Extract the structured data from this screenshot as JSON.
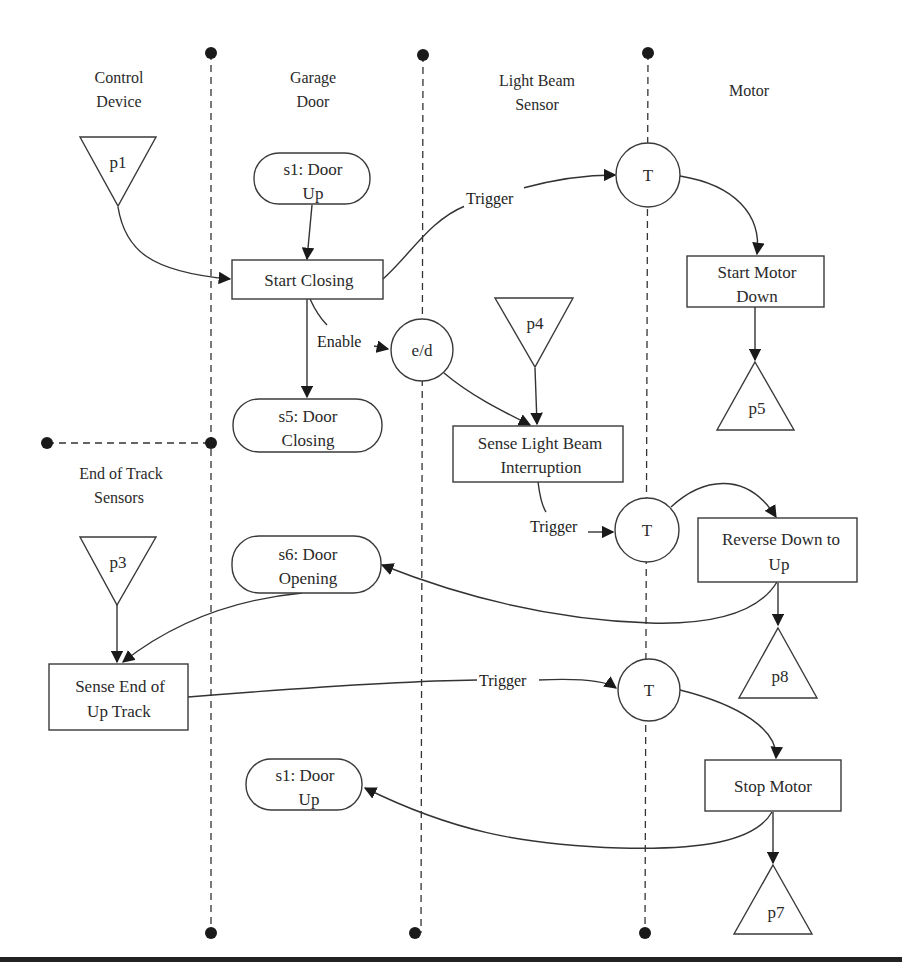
{
  "diagram": {
    "type": "swimlane-process-diagram",
    "lanes": [
      {
        "id": "control-device",
        "title_line1": "Control",
        "title_line2": "Device"
      },
      {
        "id": "garage-door",
        "title_line1": "Garage",
        "title_line2": "Door"
      },
      {
        "id": "light-beam-sensor",
        "title_line1": "Light Beam",
        "title_line2": "Sensor"
      },
      {
        "id": "motor",
        "title_line1": "Motor",
        "title_line2": ""
      },
      {
        "id": "end-of-track-sensors",
        "title_line1": "End of Track",
        "title_line2": "Sensors"
      }
    ],
    "nodes": {
      "p1": {
        "label": "p1",
        "kind": "input-place"
      },
      "p3": {
        "label": "p3",
        "kind": "input-place"
      },
      "p4": {
        "label": "p4",
        "kind": "input-place"
      },
      "p5": {
        "label": "p5",
        "kind": "output-place"
      },
      "p7": {
        "label": "p7",
        "kind": "output-place"
      },
      "p8": {
        "label": "p8",
        "kind": "output-place"
      },
      "s1_top": {
        "line1": "s1: Door",
        "line2": "Up",
        "kind": "state"
      },
      "s5": {
        "line1": "s5: Door",
        "line2": "Closing",
        "kind": "state"
      },
      "s6": {
        "line1": "s6: Door",
        "line2": "Opening",
        "kind": "state"
      },
      "s1_bottom": {
        "line1": "s1: Door",
        "line2": "Up",
        "kind": "state"
      },
      "start_closing": {
        "line1": "Start Closing",
        "line2": "",
        "kind": "activity"
      },
      "start_motor_down": {
        "line1": "Start Motor",
        "line2": "Down",
        "kind": "activity"
      },
      "sense_light_beam": {
        "line1": "Sense Light Beam",
        "line2": "Interruption",
        "kind": "activity"
      },
      "reverse_down_to_up": {
        "line1": "Reverse Down to",
        "line2": "Up",
        "kind": "activity"
      },
      "sense_end_of_track": {
        "line1": "Sense End of",
        "line2": "Up Track",
        "kind": "activity"
      },
      "stop_motor": {
        "line1": "Stop Motor",
        "line2": "",
        "kind": "activity"
      },
      "trigger_1": {
        "label": "T",
        "kind": "trigger-connector"
      },
      "trigger_2": {
        "label": "T",
        "kind": "trigger-connector"
      },
      "trigger_3": {
        "label": "T",
        "kind": "trigger-connector"
      },
      "enable_disable": {
        "label": "e/d",
        "kind": "enable-connector"
      }
    },
    "edge_labels": {
      "trigger_1": "Trigger",
      "enable": "Enable",
      "trigger_2": "Trigger",
      "trigger_3": "Trigger"
    },
    "edges": [
      {
        "from": "p1",
        "to": "start_closing"
      },
      {
        "from": "s1_top",
        "to": "start_closing"
      },
      {
        "from": "start_closing",
        "to": "trigger_1",
        "label": "Trigger"
      },
      {
        "from": "trigger_1",
        "to": "start_motor_down"
      },
      {
        "from": "start_motor_down",
        "to": "p5"
      },
      {
        "from": "start_closing",
        "to": "s5"
      },
      {
        "from": "start_closing",
        "to": "enable_disable",
        "label": "Enable"
      },
      {
        "from": "enable_disable",
        "to": "sense_light_beam"
      },
      {
        "from": "p4",
        "to": "sense_light_beam"
      },
      {
        "from": "sense_light_beam",
        "to": "trigger_2",
        "label": "Trigger"
      },
      {
        "from": "trigger_2",
        "to": "reverse_down_to_up"
      },
      {
        "from": "reverse_down_to_up",
        "to": "s6"
      },
      {
        "from": "reverse_down_to_up",
        "to": "p8"
      },
      {
        "from": "p3",
        "to": "sense_end_of_track"
      },
      {
        "from": "s6",
        "to": "sense_end_of_track"
      },
      {
        "from": "sense_end_of_track",
        "to": "trigger_3",
        "label": "Trigger"
      },
      {
        "from": "trigger_3",
        "to": "stop_motor"
      },
      {
        "from": "stop_motor",
        "to": "s1_bottom"
      },
      {
        "from": "stop_motor",
        "to": "p7"
      }
    ],
    "colors": {
      "stroke": "#333333",
      "text": "#2a2a2a",
      "background": "#ffffff"
    }
  }
}
